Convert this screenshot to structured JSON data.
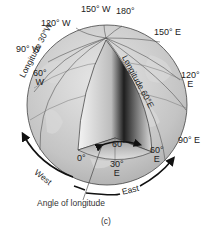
{
  "figure": {
    "panel_label": "(c)",
    "callout": "Angle of longitude",
    "angle_label": "60°",
    "meridian_labels": {
      "lon_150w": "150° W",
      "lon_180": "180°",
      "lon_120w": "120° W",
      "lon_150e": "150° E",
      "lon_90w": "90° W",
      "lon_60w_deg": "60°",
      "lon_60w_dir": "W",
      "lon_120e_deg": "120°",
      "lon_120e_dir": "E",
      "lon_90e": "90° E",
      "lon_0": "0°",
      "lon_30e_deg": "30°",
      "lon_30e_dir": "E",
      "lon_60e_deg": "60°",
      "lon_60e_dir": "E"
    },
    "rotated_labels": {
      "longitude_30w": "Longitude 30°W",
      "longitude_60e": "Longitude 60°E"
    },
    "direction_labels": {
      "west": "West",
      "east": "East"
    },
    "colors": {
      "globe_fill": "#c8c8c8",
      "wedge_dark": "#1a1a1a",
      "wedge_light": "#f2f2f2",
      "line": "#333333",
      "arrow": "#111111"
    }
  }
}
